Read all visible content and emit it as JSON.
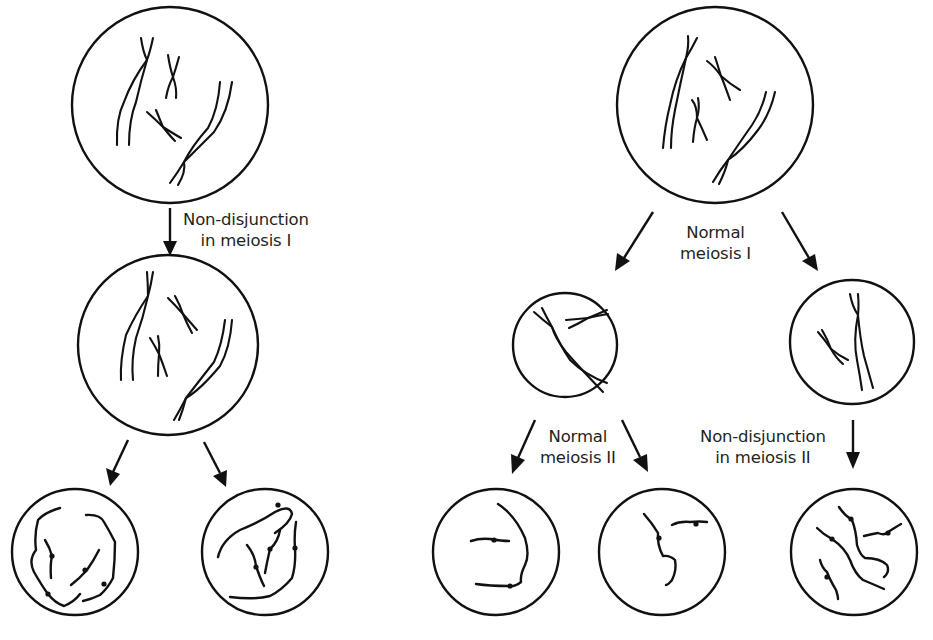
{
  "figure": {
    "title": "",
    "left_pathway": {
      "label_meiosis1": [
        "Non-disjunction",
        "in meiosis I"
      ],
      "cells": [
        "parent cell",
        "daughter cell (after meiosis I)",
        "gamete 1",
        "gamete 2"
      ]
    },
    "right_pathway": {
      "label_meiosis1": [
        "Normal",
        "meiosis I"
      ],
      "label_normal_meiosis2": [
        "Normal",
        "meiosis II"
      ],
      "label_nondisjunction_meiosis2": [
        "Non-disjunction",
        "in meiosis II"
      ],
      "cells": [
        "parent cell",
        "daughter cell A",
        "daughter cell B",
        "gamete 1",
        "gamete 2",
        "gamete 3"
      ]
    },
    "colors": {
      "ink": "#111111",
      "text": "#231f20",
      "background": "#ffffff"
    }
  }
}
